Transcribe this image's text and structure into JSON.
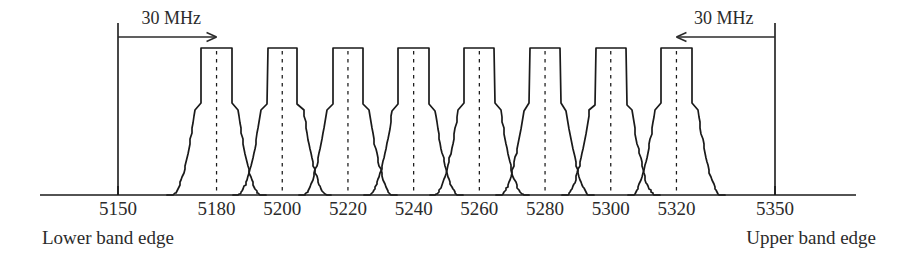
{
  "figure": {
    "title": "",
    "lower_band_edge_label": "Lower band edge",
    "upper_band_edge_label": "Upper band edge",
    "left_span_label": "30 MHz",
    "right_span_label": "30 MHz",
    "line_color": "#1a1a1a",
    "text_color": "#2b2b2b",
    "background_color": "#ffffff"
  },
  "chart_data": {
    "type": "line",
    "title": "",
    "xlabel": "",
    "ylabel": "",
    "xlim": [
      5140,
      5362
    ],
    "ylim": [
      0,
      1
    ],
    "grid": false,
    "legend": null,
    "tick_labels": [
      "5150",
      "5180",
      "5200",
      "5220",
      "5240",
      "5260",
      "5280",
      "5300",
      "5320",
      "5350"
    ],
    "tick_values": [
      5150,
      5180,
      5200,
      5220,
      5240,
      5260,
      5280,
      5300,
      5320,
      5350
    ],
    "band_edges": [
      5150,
      5350
    ],
    "channel_centers": [
      5180,
      5200,
      5220,
      5240,
      5260,
      5280,
      5300,
      5320
    ],
    "channel_count": 8,
    "channel_spacing_mhz": 20,
    "guard_band_mhz": 30,
    "annotations": [
      {
        "text": "30 MHz",
        "from": 5150,
        "to": 5180,
        "direction": "right"
      },
      {
        "text": "30 MHz",
        "from": 5350,
        "to": 5320,
        "direction": "left"
      },
      {
        "text": "Lower band edge",
        "at": 5150
      },
      {
        "text": "Upper band edge",
        "at": 5350
      }
    ],
    "mask_shape": {
      "flat_top_halfwidth_mhz": 4.6,
      "shoulder_halfwidth_mhz": 6.2,
      "shoulder_level": 0.62,
      "skirt_foot_halfwidth_mhz": 13.5,
      "crossing_level": 0.46
    },
    "series": [
      {
        "name": "channel-5180",
        "center": 5180,
        "peak": 1.0
      },
      {
        "name": "channel-5200",
        "center": 5200,
        "peak": 1.0
      },
      {
        "name": "channel-5220",
        "center": 5220,
        "peak": 1.0
      },
      {
        "name": "channel-5240",
        "center": 5240,
        "peak": 1.0
      },
      {
        "name": "channel-5260",
        "center": 5260,
        "peak": 1.0
      },
      {
        "name": "channel-5280",
        "center": 5280,
        "peak": 1.0
      },
      {
        "name": "channel-5300",
        "center": 5300,
        "peak": 1.0
      },
      {
        "name": "channel-5320",
        "center": 5320,
        "peak": 1.0
      }
    ]
  }
}
